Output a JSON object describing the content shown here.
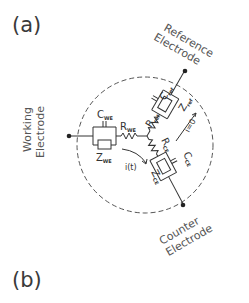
{
  "panels": {
    "a_label": "(a)",
    "b_label": "(b)"
  },
  "electrodes": {
    "working": [
      "Working",
      "Electrode"
    ],
    "reference": [
      "Reference",
      "Electrode"
    ],
    "counter": [
      "Counter",
      "Electrode"
    ]
  },
  "components": {
    "c_we": {
      "main": "C",
      "sub": "WE"
    },
    "z_we": {
      "main": "Z",
      "sub": "WE"
    },
    "r_we": {
      "main": "R",
      "sub": "WE"
    },
    "c_ref": {
      "main": "C",
      "sub": "ref"
    },
    "z_ref": {
      "main": "Z",
      "sub": "ref"
    },
    "r_ref": {
      "main": "R",
      "sub": "ref"
    },
    "c_ce": {
      "main": "C",
      "sub": "CE"
    },
    "z_ce": {
      "main": "Z",
      "sub": "CE"
    },
    "r_ce": {
      "main": "R",
      "sub": "CE"
    }
  },
  "currents": {
    "working_current": "i(t)",
    "reference_current": "i=0"
  },
  "colors": {
    "line": "#333333",
    "text": "#444444",
    "background": "#ffffff"
  }
}
